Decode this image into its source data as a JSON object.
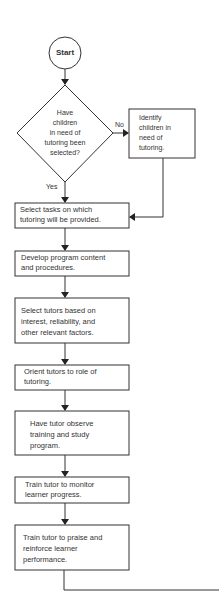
{
  "flowchart": {
    "start": {
      "label": "Start"
    },
    "decision": {
      "lines": [
        "Have",
        "children",
        "in need of",
        "tutoring been",
        "selected?"
      ],
      "yes_label": "Yes",
      "no_label": "No"
    },
    "side_box": {
      "lines": [
        "Identify",
        "children in",
        "need of",
        "tutoring."
      ]
    },
    "steps": [
      {
        "lines": [
          "Select tasks on which",
          "tutoring will be provided."
        ]
      },
      {
        "lines": [
          "Develop program content",
          "and procedures."
        ]
      },
      {
        "lines": [
          "Select tutors based on",
          "interest, reliability, and",
          "other relevant factors."
        ]
      },
      {
        "lines": [
          "Orient tutors to role of",
          "tutoring."
        ]
      },
      {
        "lines": [
          "Have tutor observe",
          "training and study",
          "program."
        ]
      },
      {
        "lines": [
          "Train tutor to monitor",
          "learner progress."
        ]
      },
      {
        "lines": [
          "Train tutor to praise and",
          "reinforce learner",
          "performance."
        ]
      }
    ],
    "colors": {
      "line": "#333333",
      "background": "#ffffff"
    }
  }
}
